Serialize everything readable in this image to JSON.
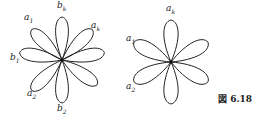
{
  "figure": {
    "caption": "図 6.18",
    "stroke_color": "#222222",
    "left_rose": {
      "petals": 8,
      "center": [
        62,
        60
      ],
      "radius": 43,
      "labels": [
        {
          "id": "b_k",
          "base": "b",
          "sub": "k",
          "x": 57,
          "y": 1
        },
        {
          "id": "a_1",
          "base": "a",
          "sub": "1",
          "x": 24,
          "y": 13
        },
        {
          "id": "a_k",
          "base": "a",
          "sub": "k",
          "x": 91,
          "y": 21
        },
        {
          "id": "b_1",
          "base": "b",
          "sub": "1",
          "x": 10,
          "y": 53
        },
        {
          "id": "a_2",
          "base": "a",
          "sub": "2",
          "x": 27,
          "y": 89
        },
        {
          "id": "b_2",
          "base": "b",
          "sub": "2",
          "x": 57,
          "y": 104
        }
      ]
    },
    "right_rose": {
      "petals": 6,
      "center": [
        171,
        62
      ],
      "radius": 42,
      "labels": [
        {
          "id": "a_k",
          "base": "a",
          "sub": "k",
          "x": 166,
          "y": 4
        },
        {
          "id": "a_1",
          "base": "a",
          "sub": "1",
          "x": 126,
          "y": 34
        },
        {
          "id": "a_2",
          "base": "a",
          "sub": "2",
          "x": 126,
          "y": 82
        }
      ]
    }
  }
}
